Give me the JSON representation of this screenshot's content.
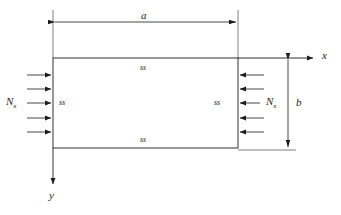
{
  "figure": {
    "stroke_color": "#1b1b1b",
    "background": "#ffffff",
    "plate": {
      "name": "rectangular-plate",
      "x": 53,
      "y": 58,
      "width": 185,
      "height": 90
    },
    "dimensions": [
      {
        "key": "a",
        "label": "a",
        "orientation": "horizontal",
        "from": 53,
        "to": 238,
        "at": 22
      },
      {
        "key": "b",
        "label": "b",
        "orientation": "vertical",
        "from": 58,
        "to": 148,
        "at": 288
      }
    ],
    "axes": [
      {
        "key": "x",
        "label": "x",
        "direction": "right",
        "origin_x": 53,
        "origin_y": 58,
        "end": 315
      },
      {
        "key": "y",
        "label": "y",
        "direction": "down",
        "origin_x": 53,
        "origin_y": 148,
        "end": 186
      }
    ],
    "edge_conditions": [
      {
        "key": "top",
        "label": "ss",
        "x": 145,
        "y": 66
      },
      {
        "key": "left",
        "label": "ss",
        "x": 59,
        "y": 100
      },
      {
        "key": "right",
        "label": "ss",
        "x": 214,
        "y": 100
      },
      {
        "key": "bottom",
        "label": "ss",
        "x": 145,
        "y": 137
      }
    ],
    "loads": [
      {
        "key": "left-load",
        "label": "N",
        "subscript": "x",
        "label_x": 6,
        "label_y": 97,
        "direction": "right",
        "arrow_count": 5,
        "arrow_start_x": 27,
        "arrow_end_x": 53,
        "arrow_ys": [
          75,
          89,
          103,
          118,
          132
        ]
      },
      {
        "key": "right-load",
        "label": "N",
        "subscript": "x",
        "label_x": 262,
        "label_y": 97,
        "direction": "left",
        "arrow_count": 5,
        "arrow_start_x": 264,
        "arrow_end_x": 238,
        "arrow_ys": [
          75,
          89,
          103,
          118,
          132
        ]
      }
    ]
  }
}
